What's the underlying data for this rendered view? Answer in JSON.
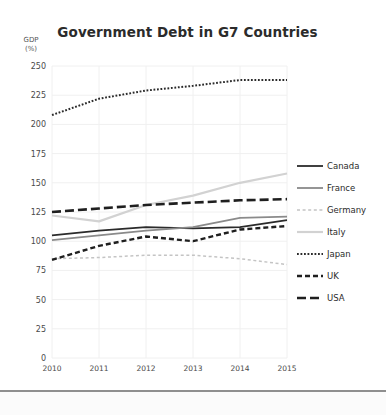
{
  "chart_data": {
    "type": "line",
    "title": "Government Debt in G7 Countries",
    "xlabel": "",
    "ylabel": "GDP\n(%)",
    "ylabel_line1": "GDP",
    "ylabel_line2": "(%)",
    "categories": [
      "2010",
      "2011",
      "2012",
      "2013",
      "2014",
      "2015"
    ],
    "x": [
      2010,
      2011,
      2012,
      2013,
      2014,
      2015
    ],
    "ylim": [
      0,
      250
    ],
    "yticks": [
      0,
      25,
      50,
      75,
      100,
      125,
      150,
      175,
      200,
      225,
      250
    ],
    "ytick_labels": [
      "0",
      "25",
      "50",
      "75",
      "100",
      "125",
      "150",
      "175",
      "200",
      "225",
      "250"
    ],
    "grid": true,
    "legend_position": "right",
    "series": [
      {
        "name": "Canada",
        "values": [
          105,
          109,
          112,
          111,
          112,
          118
        ],
        "color": "#2b2b2b",
        "style": "solid",
        "width": 1.8
      },
      {
        "name": "France",
        "values": [
          101,
          105,
          109,
          112,
          120,
          121
        ],
        "color": "#8a8a8a",
        "style": "solid",
        "width": 1.8
      },
      {
        "name": "Germany",
        "values": [
          85,
          86,
          88,
          88,
          85,
          80
        ],
        "color": "#c4c4c4",
        "style": "dashed-fine",
        "width": 1.5
      },
      {
        "name": "Italy",
        "values": [
          122,
          117,
          131,
          139,
          150,
          158
        ],
        "color": "#d2d2d2",
        "style": "solid",
        "width": 2.2
      },
      {
        "name": "Japan",
        "values": [
          208,
          222,
          229,
          233,
          238,
          238
        ],
        "color": "#2b2b2b",
        "style": "dotted",
        "width": 2.0
      },
      {
        "name": "UK",
        "values": [
          84,
          96,
          104,
          100,
          110,
          113
        ],
        "color": "#1f1f1f",
        "style": "dashed",
        "width": 2.4
      },
      {
        "name": "USA",
        "values": [
          125,
          128,
          131,
          133,
          135,
          136
        ],
        "color": "#1f1f1f",
        "style": "long-dash",
        "width": 2.6
      }
    ]
  },
  "legend": {
    "items": [
      {
        "label": "Canada"
      },
      {
        "label": "France"
      },
      {
        "label": "Germany"
      },
      {
        "label": "Italy"
      },
      {
        "label": "Japan"
      },
      {
        "label": "UK"
      },
      {
        "label": "USA"
      }
    ]
  },
  "colors": {
    "background": "#ffffff",
    "grid": "#f0f0f0",
    "text": "#2b2b2b",
    "tick": "#4a4a4a"
  }
}
